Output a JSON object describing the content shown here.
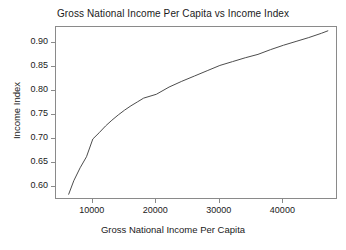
{
  "chart_data": {
    "type": "line",
    "title": "Gross National Income Per Capita vs Income Index",
    "xlabel": "Gross National Income Per Capita",
    "ylabel": "Income Index",
    "xlim": [
      4200,
      48600
    ],
    "ylim": [
      0.573,
      0.933
    ],
    "grid": false,
    "legend": null,
    "xticks": [
      10000,
      20000,
      30000,
      40000
    ],
    "xtick_labels": [
      "10000",
      "20000",
      "30000",
      "40000"
    ],
    "yticks": [
      0.6,
      0.65,
      0.7,
      0.75,
      0.8,
      0.85,
      0.9
    ],
    "ytick_labels": [
      "0.60",
      "0.65",
      "0.70",
      "0.75",
      "0.80",
      "0.85",
      "0.90"
    ],
    "line_color": "#4d4d4d",
    "line_width": 1,
    "series": [
      {
        "name": "Income Index",
        "x": [
          6200,
          7000,
          8000,
          9000,
          10000,
          11000,
          12000,
          13000,
          14000,
          15000,
          16000,
          17000,
          18000,
          19000,
          20000,
          22000,
          24000,
          26000,
          28000,
          30000,
          32000,
          34000,
          36000,
          38000,
          40000,
          42000,
          44000,
          46000,
          47000
        ],
        "y": [
          0.585,
          0.613,
          0.64,
          0.663,
          0.7,
          0.713,
          0.727,
          0.739,
          0.75,
          0.76,
          0.769,
          0.777,
          0.785,
          0.789,
          0.793,
          0.808,
          0.82,
          0.831,
          0.842,
          0.853,
          0.861,
          0.869,
          0.876,
          0.886,
          0.895,
          0.903,
          0.911,
          0.92,
          0.925
        ]
      }
    ]
  }
}
